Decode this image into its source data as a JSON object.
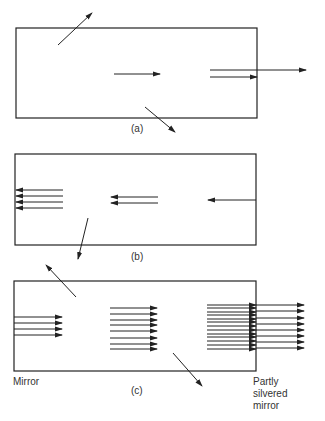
{
  "figure": {
    "panels": [
      {
        "id": "a",
        "caption": "(a)"
      },
      {
        "id": "b",
        "caption": "(b)"
      },
      {
        "id": "c",
        "caption": "(c)"
      }
    ],
    "labels": {
      "left_mirror": "Mirror",
      "right_mirror_line1": "Partly",
      "right_mirror_line2": "silvered",
      "right_mirror_line3": "mirror"
    },
    "colors": {
      "line": "#222222",
      "background": "#ffffff"
    },
    "arrow_counts": {
      "a": {
        "oblique": 2,
        "center": 1,
        "right_inside": 1,
        "right_exit": 1
      },
      "b": {
        "left": 4,
        "center": 2,
        "right": 1,
        "oblique": 2
      },
      "c": {
        "left": 4,
        "center": 8,
        "right_inside": 13,
        "right_exit": 8,
        "oblique": 2
      }
    }
  }
}
